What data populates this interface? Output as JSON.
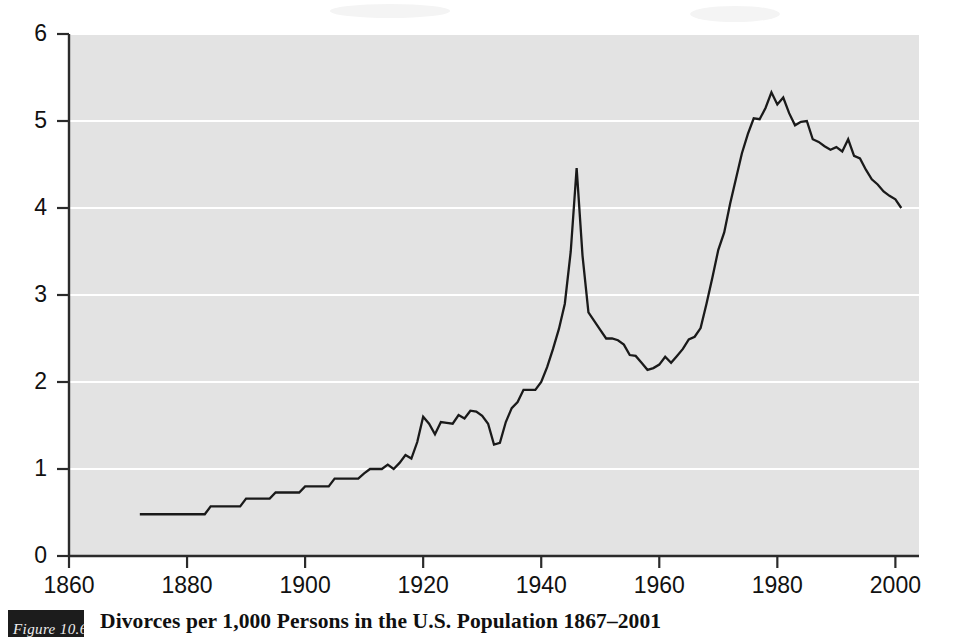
{
  "figure": {
    "number_label": "Figure 10.6",
    "caption": "Divorces per 1,000 Persons in the U.S. Population 1867–2001"
  },
  "colors": {
    "plot_background": "#e3e3e3",
    "gridline": "#ffffff",
    "line": "#1a1a1a",
    "axis": "#2b2b2b",
    "text": "#111111",
    "figure_box": "#1c1c1c",
    "page_background": "#ffffff"
  },
  "chart_data": {
    "type": "line",
    "title": "Divorces per 1,000 Persons in the U.S. Population 1867–2001",
    "xlabel": "",
    "ylabel": "",
    "xlim": [
      1860,
      2004
    ],
    "ylim": [
      0,
      6
    ],
    "grid": true,
    "grid_axis": "y",
    "legend": false,
    "xticks": [
      1860,
      1880,
      1900,
      1920,
      1940,
      1960,
      1980,
      2000
    ],
    "xticklabels": [
      "1860",
      "1880",
      "1900",
      "1920",
      "1940",
      "1960",
      "1980",
      "2000"
    ],
    "yticks": [
      0,
      1,
      2,
      3,
      4,
      5,
      6
    ],
    "yticklabels": [
      "0",
      "1",
      "2",
      "3",
      "4",
      "5",
      "6"
    ],
    "series": [
      {
        "name": "Divorces per 1,000 persons",
        "x": [
          1872,
          1873,
          1874,
          1875,
          1876,
          1877,
          1878,
          1879,
          1880,
          1881,
          1882,
          1883,
          1884,
          1885,
          1886,
          1887,
          1888,
          1889,
          1890,
          1891,
          1892,
          1893,
          1894,
          1895,
          1896,
          1897,
          1898,
          1899,
          1900,
          1901,
          1902,
          1903,
          1904,
          1905,
          1906,
          1907,
          1908,
          1909,
          1910,
          1911,
          1912,
          1913,
          1914,
          1915,
          1916,
          1917,
          1918,
          1919,
          1920,
          1921,
          1922,
          1923,
          1924,
          1925,
          1926,
          1927,
          1928,
          1929,
          1930,
          1931,
          1932,
          1933,
          1934,
          1935,
          1936,
          1937,
          1938,
          1939,
          1940,
          1941,
          1942,
          1943,
          1944,
          1945,
          1946,
          1947,
          1948,
          1949,
          1950,
          1951,
          1952,
          1953,
          1954,
          1955,
          1956,
          1957,
          1958,
          1959,
          1960,
          1961,
          1962,
          1963,
          1964,
          1965,
          1966,
          1967,
          1968,
          1969,
          1970,
          1971,
          1972,
          1973,
          1974,
          1975,
          1976,
          1977,
          1978,
          1979,
          1980,
          1981,
          1982,
          1983,
          1984,
          1985,
          1986,
          1987,
          1988,
          1989,
          1990,
          1991,
          1992,
          1993,
          1994,
          1995,
          1996,
          1997,
          1998,
          1999,
          2000,
          2001
        ],
        "y": [
          0.48,
          0.48,
          0.48,
          0.48,
          0.48,
          0.48,
          0.48,
          0.48,
          0.48,
          0.48,
          0.48,
          0.48,
          0.57,
          0.57,
          0.57,
          0.57,
          0.57,
          0.57,
          0.66,
          0.66,
          0.66,
          0.66,
          0.66,
          0.73,
          0.73,
          0.73,
          0.73,
          0.73,
          0.8,
          0.8,
          0.8,
          0.8,
          0.8,
          0.89,
          0.89,
          0.89,
          0.89,
          0.89,
          0.95,
          1.0,
          1.0,
          1.0,
          1.05,
          1.0,
          1.07,
          1.16,
          1.12,
          1.31,
          1.6,
          1.52,
          1.4,
          1.54,
          1.53,
          1.52,
          1.62,
          1.58,
          1.67,
          1.66,
          1.61,
          1.52,
          1.28,
          1.3,
          1.54,
          1.7,
          1.77,
          1.91,
          1.91,
          1.91,
          2.0,
          2.17,
          2.38,
          2.61,
          2.9,
          3.5,
          4.46,
          3.45,
          2.8,
          2.7,
          2.6,
          2.5,
          2.5,
          2.48,
          2.43,
          2.31,
          2.3,
          2.22,
          2.14,
          2.16,
          2.2,
          2.29,
          2.22,
          2.3,
          2.38,
          2.49,
          2.52,
          2.62,
          2.9,
          3.2,
          3.52,
          3.72,
          4.05,
          4.34,
          4.63,
          4.85,
          5.03,
          5.02,
          5.15,
          5.33,
          5.19,
          5.27,
          5.09,
          4.95,
          4.99,
          5.0,
          4.79,
          4.76,
          4.71,
          4.67,
          4.7,
          4.65,
          4.79,
          4.6,
          4.57,
          4.44,
          4.33,
          4.27,
          4.19,
          4.14,
          4.1,
          4.0
        ]
      }
    ]
  }
}
